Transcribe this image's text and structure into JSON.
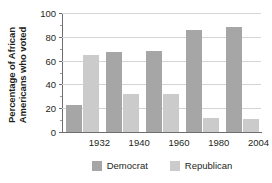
{
  "chart_data": {
    "type": "bar",
    "title": "",
    "xlabel": "",
    "ylabel": "Percentage of African Americans who voted",
    "ylabel_lines": [
      "Percentage of African",
      "Americans who voted"
    ],
    "categories": [
      "1932",
      "1940",
      "1960",
      "1980",
      "2004"
    ],
    "series": [
      {
        "name": "Democrat",
        "color": "#a6a6a6",
        "values": [
          23,
          67,
          68,
          86,
          88
        ]
      },
      {
        "name": "Republican",
        "color": "#cbcbcb",
        "values": [
          65,
          32,
          32,
          12,
          11
        ]
      }
    ],
    "ylim": [
      0,
      100
    ],
    "yticks": [
      0,
      20,
      40,
      60,
      80,
      100
    ],
    "ytick_labels": [
      "0",
      "20",
      "40",
      "60",
      "80",
      "100"
    ],
    "grid": true,
    "legend_position": "bottom"
  },
  "legend": {
    "items": [
      {
        "label": "Democrat",
        "color": "#a6a6a6"
      },
      {
        "label": "Republican",
        "color": "#cbcbcb"
      }
    ]
  }
}
